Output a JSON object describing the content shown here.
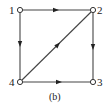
{
  "diagram": {
    "type": "directed-graph",
    "caption": "(b)",
    "nodes": [
      {
        "id": "1",
        "label": "1",
        "x": 20,
        "y": 10
      },
      {
        "id": "2",
        "label": "2",
        "x": 93,
        "y": 10
      },
      {
        "id": "3",
        "label": "3",
        "x": 93,
        "y": 82
      },
      {
        "id": "4",
        "label": "4",
        "x": 20,
        "y": 82
      }
    ],
    "edges": [
      {
        "from": "1",
        "to": "2"
      },
      {
        "from": "1",
        "to": "4"
      },
      {
        "from": "2",
        "to": "3"
      },
      {
        "from": "4",
        "to": "3"
      },
      {
        "from": "4",
        "to": "2"
      }
    ],
    "colors": {
      "edge": "#444444",
      "node_fill": "#ffffff",
      "node_stroke": "#333333",
      "text": "#222222"
    }
  }
}
